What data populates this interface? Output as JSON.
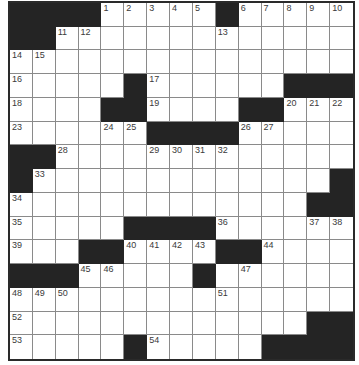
{
  "puzzle": {
    "rows": 15,
    "cols": 15,
    "colors": {
      "block": "#242424",
      "cell": "#ffffff",
      "gridline": "#8a8a8a",
      "border": "#2a2a2a",
      "number": "#3a3a3a"
    },
    "layout": [
      "####.....#.....",
      "##.............",
      "...............",
      ".....#......###",
      "....##....##...",
      "......####.....",
      "##.............",
      "#.............#",
      ".............##",
      ".....####......",
      "...##....##....",
      "###.....#......",
      "...............",
      ".............##",
      ".....#.....####"
    ],
    "numbers": [
      {
        "row": 0,
        "col": 4,
        "n": "1"
      },
      {
        "row": 0,
        "col": 5,
        "n": "2"
      },
      {
        "row": 0,
        "col": 6,
        "n": "3"
      },
      {
        "row": 0,
        "col": 7,
        "n": "4"
      },
      {
        "row": 0,
        "col": 8,
        "n": "5"
      },
      {
        "row": 0,
        "col": 10,
        "n": "6"
      },
      {
        "row": 0,
        "col": 11,
        "n": "7"
      },
      {
        "row": 0,
        "col": 12,
        "n": "8"
      },
      {
        "row": 0,
        "col": 13,
        "n": "9"
      },
      {
        "row": 0,
        "col": 14,
        "n": "10"
      },
      {
        "row": 1,
        "col": 2,
        "n": "11"
      },
      {
        "row": 1,
        "col": 3,
        "n": "12"
      },
      {
        "row": 1,
        "col": 9,
        "n": "13"
      },
      {
        "row": 2,
        "col": 0,
        "n": "14"
      },
      {
        "row": 2,
        "col": 1,
        "n": "15"
      },
      {
        "row": 3,
        "col": 0,
        "n": "16"
      },
      {
        "row": 3,
        "col": 6,
        "n": "17"
      },
      {
        "row": 4,
        "col": 0,
        "n": "18"
      },
      {
        "row": 4,
        "col": 6,
        "n": "19"
      },
      {
        "row": 4,
        "col": 12,
        "n": "20"
      },
      {
        "row": 4,
        "col": 13,
        "n": "21"
      },
      {
        "row": 4,
        "col": 14,
        "n": "22"
      },
      {
        "row": 5,
        "col": 0,
        "n": "23"
      },
      {
        "row": 5,
        "col": 4,
        "n": "24"
      },
      {
        "row": 5,
        "col": 5,
        "n": "25"
      },
      {
        "row": 5,
        "col": 10,
        "n": "26"
      },
      {
        "row": 5,
        "col": 11,
        "n": "27"
      },
      {
        "row": 6,
        "col": 2,
        "n": "28"
      },
      {
        "row": 6,
        "col": 6,
        "n": "29"
      },
      {
        "row": 6,
        "col": 7,
        "n": "30"
      },
      {
        "row": 6,
        "col": 8,
        "n": "31"
      },
      {
        "row": 6,
        "col": 9,
        "n": "32"
      },
      {
        "row": 7,
        "col": 1,
        "n": "33"
      },
      {
        "row": 8,
        "col": 0,
        "n": "34"
      },
      {
        "row": 9,
        "col": 0,
        "n": "35"
      },
      {
        "row": 9,
        "col": 9,
        "n": "36"
      },
      {
        "row": 9,
        "col": 13,
        "n": "37"
      },
      {
        "row": 9,
        "col": 14,
        "n": "38"
      },
      {
        "row": 10,
        "col": 0,
        "n": "39"
      },
      {
        "row": 10,
        "col": 5,
        "n": "40"
      },
      {
        "row": 10,
        "col": 6,
        "n": "41"
      },
      {
        "row": 10,
        "col": 7,
        "n": "42"
      },
      {
        "row": 10,
        "col": 8,
        "n": "43"
      },
      {
        "row": 10,
        "col": 11,
        "n": "44"
      },
      {
        "row": 11,
        "col": 3,
        "n": "45"
      },
      {
        "row": 11,
        "col": 4,
        "n": "46"
      },
      {
        "row": 11,
        "col": 10,
        "n": "47"
      },
      {
        "row": 12,
        "col": 0,
        "n": "48"
      },
      {
        "row": 12,
        "col": 1,
        "n": "49"
      },
      {
        "row": 12,
        "col": 2,
        "n": "50"
      },
      {
        "row": 12,
        "col": 9,
        "n": "51"
      },
      {
        "row": 13,
        "col": 0,
        "n": "52"
      },
      {
        "row": 14,
        "col": 0,
        "n": "53"
      },
      {
        "row": 14,
        "col": 6,
        "n": "54"
      }
    ]
  }
}
